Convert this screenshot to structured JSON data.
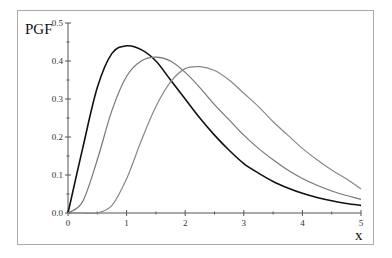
{
  "chart_data": {
    "type": "line",
    "title": "",
    "xlabel": "x",
    "ylabel": "PGF",
    "xlim": [
      0,
      5
    ],
    "ylim": [
      0,
      0.5
    ],
    "grid": false,
    "legend": null,
    "x_ticks": [
      "0",
      "1",
      "2",
      "3",
      "4",
      "5"
    ],
    "y_ticks": [
      "0.0",
      "0.1",
      "0.2",
      "0.3",
      "0.4",
      "0.5"
    ],
    "x": [
      0,
      0.25,
      0.5,
      0.75,
      1.0,
      1.25,
      1.5,
      1.75,
      2.0,
      2.25,
      2.5,
      2.75,
      3.0,
      3.25,
      3.5,
      3.75,
      4.0,
      4.25,
      4.5,
      4.75,
      5.0
    ],
    "series": [
      {
        "name": "curve-1",
        "color": "#111111",
        "values": [
          0.0,
          0.17,
          0.33,
          0.42,
          0.44,
          0.43,
          0.4,
          0.35,
          0.3,
          0.25,
          0.205,
          0.165,
          0.13,
          0.105,
          0.083,
          0.066,
          0.052,
          0.041,
          0.032,
          0.025,
          0.02
        ]
      },
      {
        "name": "curve-2",
        "color": "#777777",
        "values": [
          0.0,
          0.03,
          0.14,
          0.27,
          0.36,
          0.4,
          0.41,
          0.4,
          0.37,
          0.33,
          0.285,
          0.245,
          0.205,
          0.17,
          0.14,
          0.113,
          0.091,
          0.073,
          0.058,
          0.046,
          0.036
        ]
      },
      {
        "name": "curve-3",
        "color": "#888888",
        "values": [
          0.0,
          0.0,
          0.0,
          0.02,
          0.09,
          0.19,
          0.28,
          0.345,
          0.38,
          0.385,
          0.375,
          0.35,
          0.315,
          0.28,
          0.24,
          0.205,
          0.17,
          0.14,
          0.113,
          0.09,
          0.063
        ]
      }
    ]
  }
}
